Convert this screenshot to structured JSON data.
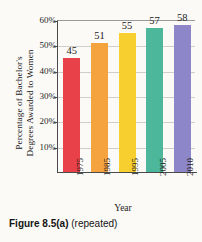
{
  "chart_data": {
    "type": "bar",
    "title": "",
    "xlabel": "Year",
    "ylabel": "Percentage of Bachelor's Degrees Awarded to Women",
    "ylabel_lines": [
      "Percentage of Bachelor's",
      "Degrees Awarded to Women"
    ],
    "categories": [
      "1975",
      "1985",
      "1995",
      "2005",
      "2010"
    ],
    "values": [
      45,
      51,
      55,
      57,
      58
    ],
    "value_labels": [
      "45",
      "51",
      "55",
      "57",
      "58"
    ],
    "ylim": [
      0,
      60
    ],
    "ytick_labels": [
      "60%",
      "50%",
      "40%",
      "30%",
      "20%",
      "10%"
    ],
    "ytick_values": [
      60,
      50,
      40,
      30,
      20,
      10
    ],
    "grid": true,
    "legend": "none",
    "bar_colors": [
      "#e8414a",
      "#f5a council",
      "#f7cf2e",
      "#4cb79a",
      "#8d86c9"
    ]
  },
  "series_colors": {
    "bar_1975": "#e8414a",
    "bar_1985": "#f5a33f",
    "bar_1995": "#f7cf2e",
    "bar_2005": "#4cb79a",
    "bar_2010": "#8d86c9"
  },
  "caption": {
    "figure_number": "Figure 8.5(a)",
    "note": "(repeated)"
  }
}
